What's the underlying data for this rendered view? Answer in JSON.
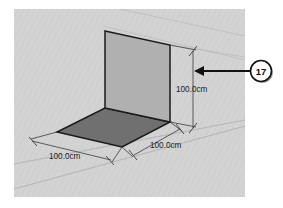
{
  "figure": {
    "background_color": "#d2d2d2",
    "page_color": "#ffffff"
  },
  "viewport": {
    "name": "3d-viewport",
    "x": 14,
    "y": 9,
    "width": 231,
    "height": 188,
    "fill": "#d2d2d2"
  },
  "model": {
    "wall_panel": {
      "label": "wall-panel",
      "fill": "#b0b0b0",
      "edge_color": "#1a1a1a",
      "points": "105,31 170,45 170,122 105,108"
    },
    "floor_panel": {
      "label": "floor-panel",
      "fill": "#707070",
      "edge_color": "#1a1a1a",
      "points": "105,108 170,122 122,147 57,132"
    }
  },
  "dimensions": [
    {
      "name": "dimension-height",
      "value": "100.0cm",
      "axis": "vertical",
      "text_x": 176,
      "text_y": 92
    },
    {
      "name": "dimension-depth",
      "value": "100.0cm",
      "axis": "right-depth",
      "text_x": 150,
      "text_y": 148
    },
    {
      "name": "dimension-width",
      "value": "100.0cm",
      "axis": "left-width",
      "text_x": 49,
      "text_y": 159
    }
  ],
  "callout": {
    "name": "callout-17",
    "number": "17",
    "circle_cx": 261,
    "circle_cy": 71,
    "circle_r": 10.5,
    "arrow_tip_x": 194,
    "arrow_tip_y": 71,
    "arrow_tail_x": 250,
    "arrow_tail_y": 71,
    "color": "#111111"
  }
}
